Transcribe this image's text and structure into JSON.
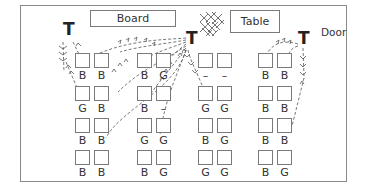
{
  "diagram": {
    "landmarks": {
      "board": "Board",
      "table": "Table",
      "door": "Door"
    },
    "teachers": [
      {
        "label": "T",
        "position": "left, near board"
      },
      {
        "label": "T",
        "position": "center, beside table (cross-hatched area)"
      },
      {
        "label": "T",
        "position": "right, near door"
      }
    ],
    "legend": {
      "B": "boy",
      "G": "girl",
      "-": "empty"
    },
    "columns": [
      {
        "name": "group-1",
        "rows": [
          [
            "B",
            "B"
          ],
          [
            "G",
            "B"
          ],
          [
            "B",
            "B"
          ],
          [
            "B",
            "B"
          ]
        ]
      },
      {
        "name": "group-2",
        "rows": [
          [
            "B",
            "G"
          ],
          [
            "B",
            "–"
          ],
          [
            "G",
            "G"
          ],
          [
            "B",
            "G"
          ]
        ]
      },
      {
        "name": "group-3",
        "rows": [
          [
            "–",
            "–"
          ],
          [
            "G",
            "G"
          ],
          [
            "B",
            "G"
          ],
          [
            "G",
            "G"
          ]
        ]
      },
      {
        "name": "group-4",
        "rows": [
          [
            "B",
            "B"
          ],
          [
            "B",
            "B"
          ],
          [
            "B",
            "B"
          ],
          [
            "B",
            "G"
          ]
        ]
      }
    ]
  }
}
